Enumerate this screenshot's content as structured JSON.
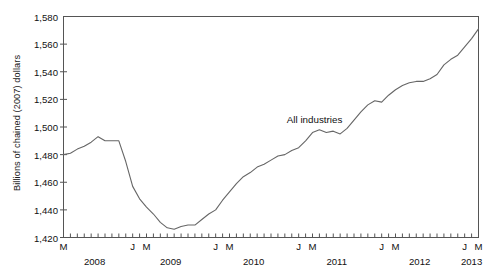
{
  "chart_data": {
    "type": "line",
    "title": "",
    "xlabel": "",
    "ylabel": "Billions of chained (2007) dollars",
    "ylim": [
      1420,
      1580
    ],
    "yticks": [
      1420,
      1440,
      1460,
      1480,
      1500,
      1520,
      1540,
      1560,
      1580
    ],
    "ytick_labels": [
      "1,420",
      "1,440",
      "1,460",
      "1,480",
      "1,500",
      "1,520",
      "1,540",
      "1,560",
      "1,580"
    ],
    "grid": false,
    "legend_position": "inline-annotation",
    "annotations": [
      {
        "text": "All industries",
        "x": "2010-11",
        "y": 1505
      }
    ],
    "series": [
      {
        "name": "All industries",
        "color": "#666666",
        "x": [
          "2008-03",
          "2008-04",
          "2008-05",
          "2008-06",
          "2008-07",
          "2008-08",
          "2008-09",
          "2008-10",
          "2008-11",
          "2008-12",
          "2009-01",
          "2009-02",
          "2009-03",
          "2009-04",
          "2009-05",
          "2009-06",
          "2009-07",
          "2009-08",
          "2009-09",
          "2009-10",
          "2009-11",
          "2009-12",
          "2010-01",
          "2010-02",
          "2010-03",
          "2010-04",
          "2010-05",
          "2010-06",
          "2010-07",
          "2010-08",
          "2010-09",
          "2010-10",
          "2010-11",
          "2010-12",
          "2011-01",
          "2011-02",
          "2011-03",
          "2011-04",
          "2011-05",
          "2011-06",
          "2011-07",
          "2011-08",
          "2011-09",
          "2011-10",
          "2011-11",
          "2011-12",
          "2012-01",
          "2012-02",
          "2012-03",
          "2012-04",
          "2012-05",
          "2012-06",
          "2012-07",
          "2012-08",
          "2012-09",
          "2012-10",
          "2012-11",
          "2012-12",
          "2013-01",
          "2013-02",
          "2013-03"
        ],
        "values": [
          1480,
          1481,
          1484,
          1486,
          1489,
          1493,
          1490,
          1490,
          1490,
          1475,
          1457,
          1448,
          1442,
          1437,
          1431,
          1427,
          1426,
          1428,
          1429,
          1429,
          1433,
          1437,
          1440,
          1447,
          1453,
          1459,
          1464,
          1467,
          1471,
          1473,
          1476,
          1479,
          1480,
          1483,
          1485,
          1490,
          1496,
          1498,
          1496,
          1497,
          1495,
          1499,
          1505,
          1511,
          1516,
          1519,
          1518,
          1523,
          1527,
          1530,
          1532,
          1533,
          1533,
          1535,
          1538,
          1545,
          1549,
          1552,
          1558,
          1564,
          1571
        ]
      }
    ],
    "x_axis": {
      "year_labels": [
        "2008",
        "2009",
        "2010",
        "2011",
        "2012",
        "2013"
      ],
      "month_ticks": [
        {
          "label": "M",
          "x": "2008-03"
        },
        {
          "label": "J",
          "x": "2009-01"
        },
        {
          "label": "M",
          "x": "2009-03"
        },
        {
          "label": "J",
          "x": "2010-01"
        },
        {
          "label": "M",
          "x": "2010-03"
        },
        {
          "label": "J",
          "x": "2011-01"
        },
        {
          "label": "M",
          "x": "2011-03"
        },
        {
          "label": "J",
          "x": "2012-01"
        },
        {
          "label": "M",
          "x": "2012-03"
        },
        {
          "label": "J",
          "x": "2013-01"
        },
        {
          "label": "M",
          "x": "2013-03"
        }
      ]
    }
  }
}
